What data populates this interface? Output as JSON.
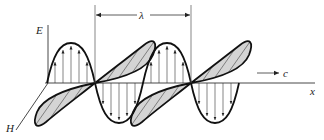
{
  "diagram": {
    "labels": {
      "electric_field": "E",
      "magnetic_field": "H",
      "propagation_axis": "x",
      "speed": "c",
      "wavelength": "λ"
    },
    "colors": {
      "stroke": "#111111",
      "fill": "#d4d4d4",
      "thin": "#444444"
    }
  }
}
